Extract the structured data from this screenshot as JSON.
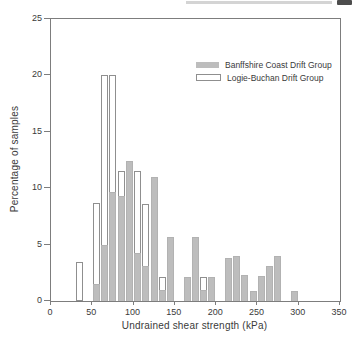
{
  "figure": {
    "ylabel": "Percentage of samples",
    "xlabel": "Undrained shear strength (kPa)"
  },
  "legend": {
    "items": [
      {
        "label": "Banffshire Coast Drift Group",
        "swatch": "filled"
      },
      {
        "label": "Logie-Buchan Drift Group",
        "swatch": "outlined"
      }
    ]
  },
  "colors": {
    "banffshire_fill": "#bdbdbd",
    "logie_buchan_fill": "#ffffff",
    "outline": "#8f8f8f",
    "axis": "#7d7d7d",
    "text": "#3a3a3a"
  },
  "chart_data": {
    "type": "bar",
    "subtype": "overlapping-histogram",
    "title": "",
    "xlabel": "Undrained shear strength (kPa)",
    "ylabel": "Percentage of samples",
    "xlim": [
      0,
      350
    ],
    "ylim": [
      0,
      25
    ],
    "x_ticks": [
      0,
      50,
      100,
      150,
      200,
      250,
      300,
      350
    ],
    "y_ticks": [
      0,
      5,
      10,
      15,
      20,
      25
    ],
    "bin_width_kpa": 10,
    "grid": false,
    "legend_position": "top-right-inside",
    "series": [
      {
        "name": "Banffshire Coast Drift Group",
        "style": "filled",
        "bins_note": "pairs of [bin_start_kPa, percent_of_samples]",
        "bins": [
          [
            50,
            1.5
          ],
          [
            60,
            5.0
          ],
          [
            70,
            9.7
          ],
          [
            80,
            9.3
          ],
          [
            90,
            12.4
          ],
          [
            100,
            4.3
          ],
          [
            110,
            3.1
          ],
          [
            120,
            11.0
          ],
          [
            130,
            1.0
          ],
          [
            140,
            5.7
          ],
          [
            160,
            2.1
          ],
          [
            170,
            5.7
          ],
          [
            180,
            1.0
          ],
          [
            190,
            2.1
          ],
          [
            210,
            3.8
          ],
          [
            220,
            4.0
          ],
          [
            230,
            2.3
          ],
          [
            240,
            0.9
          ],
          [
            250,
            2.2
          ],
          [
            260,
            3.1
          ],
          [
            270,
            4.0
          ],
          [
            290,
            0.9
          ]
        ]
      },
      {
        "name": "Logie-Buchan Drift Group",
        "style": "outlined",
        "bins_note": "pairs of [bin_start_kPa, percent_of_samples]",
        "bins": [
          [
            30,
            3.5
          ],
          [
            50,
            8.7
          ],
          [
            60,
            20.0
          ],
          [
            70,
            20.0
          ],
          [
            80,
            11.5
          ],
          [
            90,
            12.4
          ],
          [
            100,
            11.5
          ],
          [
            110,
            8.6
          ],
          [
            130,
            2.1
          ],
          [
            180,
            2.1
          ]
        ]
      }
    ]
  }
}
